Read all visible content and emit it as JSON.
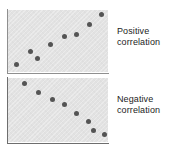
{
  "figure": {
    "kind": "scatter-plot-pair",
    "background_color": "#ffffff",
    "panel_background_color": "#e2e2e2",
    "axis_color": "#8f8f8f",
    "dot_color": "#545454",
    "text_color": "#1c1c1c"
  },
  "captions": {
    "positive": {
      "line1": "Positive",
      "line2": "correlation"
    },
    "negative": {
      "line1": "Negative",
      "line2": "correlation"
    }
  },
  "chart_data": [
    {
      "type": "scatter",
      "title": "Positive correlation",
      "xlabel": "",
      "ylabel": "",
      "xlim": [
        0,
        100
      ],
      "ylim": [
        0,
        100
      ],
      "grid": false,
      "legend": "none",
      "axis_ticks": false,
      "marker_color": "#545454",
      "panel_color": "#e2e2e2",
      "annotation": "Positive correlation",
      "annotation_position": "right-of-panel",
      "points": [
        {
          "x": 8,
          "y": 12
        },
        {
          "x": 22,
          "y": 33
        },
        {
          "x": 29,
          "y": 22
        },
        {
          "x": 42,
          "y": 45
        },
        {
          "x": 56,
          "y": 58
        },
        {
          "x": 68,
          "y": 60
        },
        {
          "x": 81,
          "y": 76
        },
        {
          "x": 93,
          "y": 92
        }
      ]
    },
    {
      "type": "scatter",
      "title": "Negative correlation",
      "xlabel": "",
      "ylabel": "",
      "xlim": [
        0,
        100
      ],
      "ylim": [
        0,
        100
      ],
      "grid": false,
      "legend": "none",
      "axis_ticks": false,
      "marker_color": "#545454",
      "panel_color": "#e2e2e2",
      "annotation": "Negative correlation",
      "annotation_position": "right-of-panel",
      "points": [
        {
          "x": 16,
          "y": 92
        },
        {
          "x": 30,
          "y": 78
        },
        {
          "x": 44,
          "y": 66
        },
        {
          "x": 56,
          "y": 58
        },
        {
          "x": 68,
          "y": 44
        },
        {
          "x": 80,
          "y": 32
        },
        {
          "x": 85,
          "y": 18
        },
        {
          "x": 96,
          "y": 12
        }
      ]
    }
  ]
}
